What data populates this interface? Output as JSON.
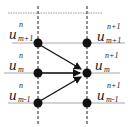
{
  "diagram": {
    "type": "finite-difference-stencil",
    "columns": [
      {
        "time_level": "n",
        "x": 38
      },
      {
        "time_level": "n+1",
        "x": 87
      }
    ],
    "rows": [
      {
        "space_index": "m+1",
        "y": 43
      },
      {
        "space_index": "m",
        "y": 73
      },
      {
        "space_index": "m-1",
        "y": 103
      }
    ],
    "labels": {
      "left_top": {
        "base": "u",
        "sup": "n",
        "sub": "m+1"
      },
      "left_mid": {
        "base": "u",
        "sup": "n",
        "sub": "m"
      },
      "left_bot": {
        "base": "u",
        "sup": "n",
        "sub": "m-1"
      },
      "right_top": {
        "base": "u",
        "sup": "n+1",
        "sub": "m+1"
      },
      "right_mid": {
        "base": "u",
        "sup": "n+1",
        "sub": "m"
      },
      "right_bot": {
        "base": "u",
        "sup": "n+1",
        "sub": "m-1"
      }
    },
    "arrows": [
      {
        "from": "u_{m+1}^{n}",
        "to": "u_{m}^{n+1}"
      },
      {
        "from": "u_{m}^{n}",
        "to": "u_{m}^{n+1}"
      },
      {
        "from": "u_{m-1}^{n}",
        "to": "u_{m}^{n+1}"
      }
    ],
    "colors": {
      "node": "#111111",
      "grid": "#9a9a9a",
      "arrow": "#111111"
    }
  }
}
